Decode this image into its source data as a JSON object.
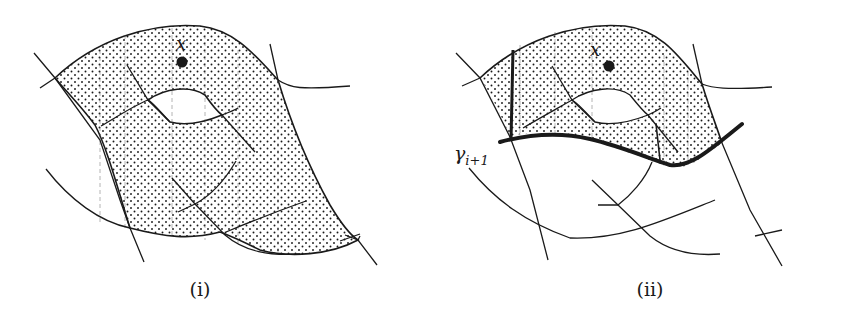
{
  "figure": {
    "panels": [
      {
        "id": "i",
        "caption": "(i)",
        "point_label": "x",
        "description": "Shaded (stippled) region bounded by curves, containing point x and a hole; several crossing curve segments."
      },
      {
        "id": "ii",
        "caption": "(ii)",
        "point_label": "x",
        "curve_label_base": "γ",
        "curve_label_sub": "i+1",
        "description": "Same configuration cut by thick curve γ_{i+1}; shaded region restricted to the part above γ_{i+1}, bounded by thick vertical segment on the left."
      }
    ],
    "colors": {
      "stroke": "#1a1a1a",
      "fill_stipple": "#1a1a1a",
      "background": "#ffffff"
    }
  }
}
